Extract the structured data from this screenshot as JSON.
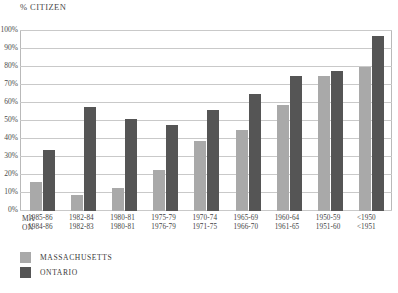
{
  "chart_data": {
    "type": "bar",
    "title": "% CITIZEN",
    "xlabel": "",
    "ylabel": "% CITIZEN",
    "ylim": [
      0,
      100
    ],
    "grid": true,
    "legend_position": "bottom-left",
    "ytick_labels": [
      "100%",
      "90%",
      "80%",
      "70%",
      "60%",
      "50%",
      "40%",
      "30%",
      "20%",
      "10%",
      "0%"
    ],
    "ytick_values": [
      100,
      90,
      80,
      70,
      60,
      50,
      40,
      30,
      20,
      10,
      0
    ],
    "row_keys": [
      "MA",
      "ON"
    ],
    "categories_ma": [
      "1985-86",
      "1982-84",
      "1980-81",
      "1975-79",
      "1970-74",
      "1965-69",
      "1960-64",
      "1950-59",
      "<1950"
    ],
    "categories_on": [
      "1984-86",
      "1982-83",
      "1980-81",
      "1976-79",
      "1971-75",
      "1966-70",
      "1961-65",
      "1951-60",
      "<1951"
    ],
    "series": [
      {
        "name": "MASSACHUSETTS",
        "color": "#a9a9a9",
        "values": [
          16,
          9,
          13,
          23,
          39,
          45,
          59,
          75,
          80
        ]
      },
      {
        "name": "ONTARIO",
        "color": "#555555",
        "values": [
          34,
          58,
          51,
          48,
          56,
          65,
          75,
          78,
          97
        ]
      }
    ]
  },
  "legend": {
    "items": [
      {
        "label": "MASSACHUSETTS",
        "color": "#a9a9a9"
      },
      {
        "label": "ONTARIO",
        "color": "#555555"
      }
    ]
  }
}
